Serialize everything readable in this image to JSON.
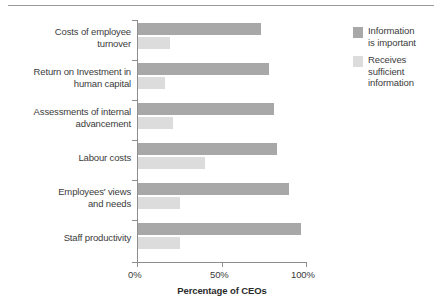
{
  "chart_data": {
    "type": "bar",
    "orientation": "horizontal",
    "title": "",
    "xlabel": "Percentage of CEOs",
    "ylabel": "",
    "xlim": [
      0,
      100
    ],
    "xticks": [
      "0%",
      "50%",
      "100%"
    ],
    "xtick_values": [
      0,
      50,
      100
    ],
    "grid": false,
    "legend_position": "right",
    "categories": [
      "Costs of employee\nturnover",
      "Return on Investment in\nhuman capital",
      "Assessments of internal\nadvancement",
      "Labour costs",
      "Employees' views\nand needs",
      "Staff productivity"
    ],
    "series": [
      {
        "name": "Information\nis important",
        "color": "#a8a8a8",
        "values": [
          73,
          78,
          81,
          83,
          90,
          97
        ]
      },
      {
        "name": "Receives\nsufficient\ninformation",
        "color": "#dcdcdc",
        "values": [
          19,
          16,
          21,
          40,
          25,
          25
        ]
      }
    ]
  },
  "legend": {
    "items": [
      {
        "label": "Information\nis important",
        "swatch": "dark"
      },
      {
        "label": "Receives\nsufficient\ninformation",
        "swatch": "light"
      }
    ]
  },
  "axis": {
    "x_title": "Percentage of CEOs",
    "tick_labels": [
      "0%",
      "50%",
      "100%"
    ]
  }
}
